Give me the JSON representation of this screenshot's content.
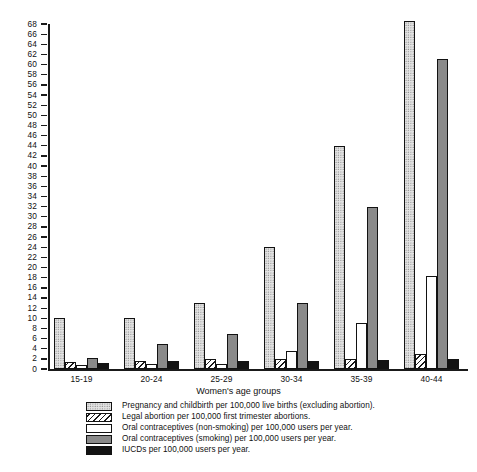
{
  "chart_data": {
    "type": "bar",
    "title": "",
    "xlabel": "Women's age groups",
    "ylabel": "",
    "ylim": [
      0,
      68
    ],
    "ytick_step": 2,
    "grid": false,
    "legend_position": "bottom",
    "categories": [
      "15-19",
      "20-24",
      "25-29",
      "30-34",
      "35-39",
      "40-44"
    ],
    "yticks": [
      0,
      2,
      4,
      6,
      8,
      10,
      12,
      14,
      16,
      18,
      20,
      22,
      24,
      26,
      28,
      30,
      32,
      34,
      36,
      38,
      40,
      42,
      44,
      46,
      48,
      50,
      52,
      54,
      56,
      58,
      60,
      62,
      64,
      66,
      68
    ],
    "series": [
      {
        "name": "Pregnancy and childbirth per 100,000 live births (excluding abortion).",
        "pattern": "stipple",
        "color": "#e4e4e4",
        "values": [
          10.0,
          10.0,
          13.0,
          24.0,
          44.0,
          68.5
        ]
      },
      {
        "name": "Legal abortion per 100,000 first trimester abortions.",
        "pattern": "diagonal-hatch",
        "color": "#ffffff",
        "values": [
          1.3,
          1.5,
          2.0,
          2.0,
          2.0,
          3.0
        ]
      },
      {
        "name": "Oral contraceptives (non-smoking) per 100,000 users per year.",
        "pattern": "solid-white",
        "color": "#ffffff",
        "values": [
          0.8,
          0.9,
          1.0,
          3.5,
          9.0,
          18.4
        ]
      },
      {
        "name": "Oral contraceptives (smoking) per 100,000 users per year.",
        "pattern": "solid-gray",
        "color": "#8a8a8a",
        "values": [
          2.2,
          5.0,
          7.0,
          13.0,
          32.0,
          61.2
        ]
      },
      {
        "name": "IUCDs per 100,000 users per year.",
        "pattern": "solid-black",
        "color": "#131313",
        "values": [
          1.1,
          1.5,
          1.6,
          1.6,
          1.8,
          2.0
        ]
      }
    ]
  },
  "axis": {
    "x_title": "Women's age groups"
  }
}
